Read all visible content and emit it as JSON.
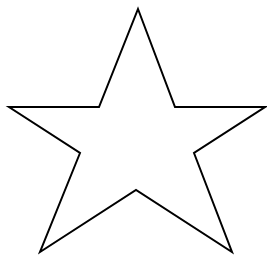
{
  "figure": {
    "shape": "five-pointed-star-outline",
    "background": "#ffffff",
    "stroke": "#000000",
    "fill": "#ffffff",
    "stroke_width": 2,
    "points": [
      [
        138,
        9
      ],
      [
        175,
        107
      ],
      [
        265,
        107
      ],
      [
        194,
        153
      ],
      [
        232,
        252
      ],
      [
        136,
        190
      ],
      [
        40,
        252
      ],
      [
        80,
        153
      ],
      [
        9,
        107
      ],
      [
        99,
        107
      ]
    ]
  }
}
